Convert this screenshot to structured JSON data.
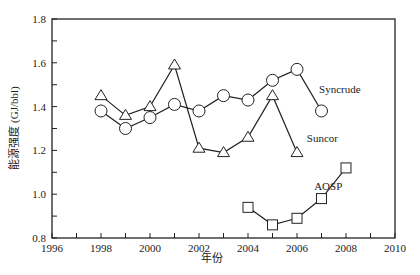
{
  "chart_data": {
    "type": "line",
    "title": "",
    "xlabel": "年份",
    "ylabel": "能源强度 (GJ/bbl)",
    "xlim": [
      1996,
      2010
    ],
    "ylim": [
      0.8,
      1.8
    ],
    "xticks": [
      1996,
      1998,
      2000,
      2002,
      2004,
      2006,
      2008,
      2010
    ],
    "yticks": [
      0.8,
      1.0,
      1.2,
      1.4,
      1.6,
      1.8
    ],
    "grid": false,
    "legend": "inline labels",
    "series": [
      {
        "name": "Syncrude",
        "marker": "circle",
        "x": [
          1998,
          1999,
          2000,
          2001,
          2002,
          2003,
          2004,
          2005,
          2006,
          2007
        ],
        "values": [
          1.38,
          1.3,
          1.35,
          1.41,
          1.38,
          1.45,
          1.43,
          1.52,
          1.57,
          1.38
        ],
        "label_pos": [
          2006.9,
          1.46
        ]
      },
      {
        "name": "Suncor",
        "marker": "triangle",
        "x": [
          1998,
          1999,
          2000,
          2001,
          2002,
          2003,
          2004,
          2005,
          2006
        ],
        "values": [
          1.45,
          1.36,
          1.4,
          1.59,
          1.21,
          1.19,
          1.26,
          1.45,
          1.19
        ],
        "label_pos": [
          2006.4,
          1.24
        ]
      },
      {
        "name": "AOSP",
        "marker": "square",
        "x": [
          2004,
          2005,
          2006,
          2007,
          2008
        ],
        "values": [
          0.94,
          0.86,
          0.89,
          0.98,
          1.12
        ],
        "label_pos": [
          2006.7,
          1.02
        ]
      }
    ]
  }
}
